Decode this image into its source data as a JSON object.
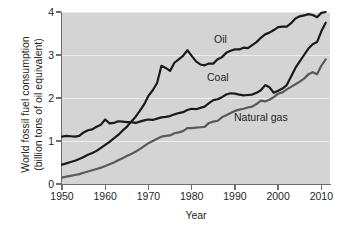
{
  "chart_data": {
    "type": "line",
    "title": "",
    "xlabel": "Year",
    "ylabel": "World fossil fuel consumption (billion tons of oil equivalent)",
    "ylabel_line1": "World fossil fuel consumption",
    "ylabel_line2": "(billion tons of oil equivalent)",
    "xlim": [
      1950,
      2012
    ],
    "ylim": [
      0,
      4
    ],
    "xticks": [
      1950,
      1960,
      1970,
      1980,
      1990,
      2000,
      2010
    ],
    "yticks": [
      0,
      1,
      2,
      3,
      4
    ],
    "grid": "horizontal",
    "legend_position": "inline-annotations",
    "background_color": "#d4d4d4",
    "series": [
      {
        "name": "Oil",
        "color": "#1a1a1a",
        "label_x": 1984,
        "label_y": 3.35,
        "x": [
          1950,
          1951,
          1952,
          1953,
          1954,
          1955,
          1956,
          1957,
          1958,
          1959,
          1960,
          1961,
          1962,
          1963,
          1964,
          1965,
          1966,
          1967,
          1968,
          1969,
          1970,
          1971,
          1972,
          1973,
          1974,
          1975,
          1976,
          1977,
          1978,
          1979,
          1980,
          1981,
          1982,
          1983,
          1984,
          1985,
          1986,
          1987,
          1988,
          1989,
          1990,
          1991,
          1992,
          1993,
          1994,
          1995,
          1996,
          1997,
          1998,
          1999,
          2000,
          2001,
          2002,
          2003,
          2004,
          2005,
          2006,
          2007,
          2008,
          2009,
          2010,
          2011
        ],
        "values": [
          0.45,
          0.48,
          0.51,
          0.54,
          0.58,
          0.63,
          0.68,
          0.72,
          0.77,
          0.84,
          0.91,
          0.98,
          1.06,
          1.14,
          1.24,
          1.33,
          1.45,
          1.56,
          1.7,
          1.85,
          2.05,
          2.18,
          2.35,
          2.75,
          2.7,
          2.63,
          2.82,
          2.9,
          2.98,
          3.11,
          2.98,
          2.85,
          2.78,
          2.76,
          2.8,
          2.8,
          2.9,
          2.95,
          3.05,
          3.1,
          3.13,
          3.13,
          3.17,
          3.16,
          3.23,
          3.3,
          3.4,
          3.48,
          3.52,
          3.58,
          3.65,
          3.66,
          3.66,
          3.74,
          3.85,
          3.9,
          3.92,
          3.95,
          3.93,
          3.88,
          3.98,
          4.0
        ]
      },
      {
        "name": "Coal",
        "color": "#1a1a1a",
        "label_x": 1982,
        "label_y": 2.45,
        "x": [
          1950,
          1951,
          1952,
          1953,
          1954,
          1955,
          1956,
          1957,
          1958,
          1959,
          1960,
          1961,
          1962,
          1963,
          1964,
          1965,
          1966,
          1967,
          1968,
          1969,
          1970,
          1971,
          1972,
          1973,
          1974,
          1975,
          1976,
          1977,
          1978,
          1979,
          1980,
          1981,
          1982,
          1983,
          1984,
          1985,
          1986,
          1987,
          1988,
          1989,
          1990,
          1991,
          1992,
          1993,
          1994,
          1995,
          1996,
          1997,
          1998,
          1999,
          2000,
          2001,
          2002,
          2003,
          2004,
          2005,
          2006,
          2007,
          2008,
          2009,
          2010,
          2011
        ],
        "values": [
          1.1,
          1.12,
          1.11,
          1.1,
          1.12,
          1.2,
          1.25,
          1.27,
          1.33,
          1.38,
          1.5,
          1.41,
          1.42,
          1.46,
          1.45,
          1.44,
          1.44,
          1.42,
          1.45,
          1.48,
          1.5,
          1.49,
          1.52,
          1.55,
          1.56,
          1.58,
          1.62,
          1.65,
          1.67,
          1.72,
          1.75,
          1.74,
          1.77,
          1.8,
          1.88,
          1.95,
          1.97,
          2.02,
          2.08,
          2.11,
          2.1,
          2.08,
          2.06,
          2.07,
          2.08,
          2.12,
          2.18,
          2.3,
          2.25,
          2.12,
          2.17,
          2.22,
          2.3,
          2.5,
          2.7,
          2.85,
          3.0,
          3.15,
          3.25,
          3.3,
          3.55,
          3.75
        ]
      },
      {
        "name": "Natural gas",
        "color": "#595959",
        "label_x": 2001,
        "label_y": 1.62,
        "x": [
          1950,
          1951,
          1952,
          1953,
          1954,
          1955,
          1956,
          1957,
          1958,
          1959,
          1960,
          1961,
          1962,
          1963,
          1964,
          1965,
          1966,
          1967,
          1968,
          1969,
          1970,
          1971,
          1972,
          1973,
          1974,
          1975,
          1976,
          1977,
          1978,
          1979,
          1980,
          1981,
          1982,
          1983,
          1984,
          1985,
          1986,
          1987,
          1988,
          1989,
          1990,
          1991,
          1992,
          1993,
          1994,
          1995,
          1996,
          1997,
          1998,
          1999,
          2000,
          2001,
          2002,
          2003,
          2004,
          2005,
          2006,
          2007,
          2008,
          2009,
          2010,
          2011
        ],
        "values": [
          0.15,
          0.17,
          0.19,
          0.21,
          0.23,
          0.26,
          0.29,
          0.32,
          0.35,
          0.38,
          0.42,
          0.46,
          0.5,
          0.55,
          0.6,
          0.65,
          0.7,
          0.75,
          0.81,
          0.88,
          0.95,
          1.0,
          1.05,
          1.1,
          1.12,
          1.13,
          1.18,
          1.2,
          1.23,
          1.3,
          1.3,
          1.31,
          1.32,
          1.33,
          1.42,
          1.45,
          1.47,
          1.55,
          1.6,
          1.65,
          1.7,
          1.73,
          1.75,
          1.78,
          1.8,
          1.86,
          1.94,
          1.92,
          1.96,
          2.02,
          2.1,
          2.13,
          2.2,
          2.26,
          2.32,
          2.38,
          2.45,
          2.55,
          2.6,
          2.55,
          2.75,
          2.9
        ]
      }
    ]
  },
  "axis": {
    "x_tick_labels": [
      "1950",
      "1960",
      "1970",
      "1980",
      "1990",
      "2000",
      "2010"
    ],
    "y_tick_labels": [
      "0",
      "1",
      "2",
      "3",
      "4"
    ],
    "x_title": "Year",
    "y_title_line1": "World fossil fuel consumption",
    "y_title_line2": "(billion tons of oil equivalent)"
  },
  "annotations": {
    "oil": "Oil",
    "coal": "Coal",
    "natural_gas": "Natural gas"
  }
}
